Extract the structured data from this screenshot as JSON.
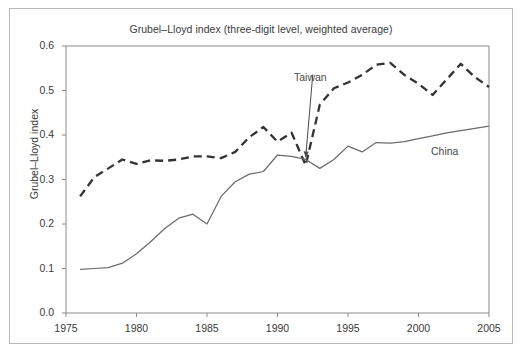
{
  "chart_data": {
    "type": "line",
    "title": "Grubel–Lloyd index (three-digit level, weighted average)",
    "xlabel": "",
    "ylabel": "Grubel–Lloyd index",
    "xlim": [
      1975,
      2005
    ],
    "ylim": [
      0.0,
      0.6
    ],
    "xticks": [
      1975,
      1980,
      1985,
      1990,
      1995,
      2000,
      2005
    ],
    "xtick_labels": [
      "1975",
      "1980",
      "1985",
      "1990",
      "1995",
      "2000",
      "2005"
    ],
    "yticks": [
      0.0,
      0.1,
      0.2,
      0.3,
      0.4,
      0.5,
      0.6
    ],
    "ytick_labels": [
      "0.0",
      "0.1",
      "0.2",
      "0.3",
      "0.4",
      "0.5",
      "0.6"
    ],
    "grid": false,
    "legend_position": "inline-annotation",
    "x": [
      1976,
      1977,
      1978,
      1979,
      1980,
      1981,
      1982,
      1983,
      1984,
      1985,
      1986,
      1987,
      1988,
      1989,
      1990,
      1991,
      1992,
      1993,
      1994,
      1995,
      1996,
      1997,
      1998,
      1999,
      2000,
      2001,
      2002,
      2003,
      2004,
      2005
    ],
    "series": [
      {
        "name": "Taiwan",
        "style": "dashed",
        "color": "#333333",
        "values": [
          0.262,
          0.305,
          0.325,
          0.345,
          0.335,
          0.343,
          0.342,
          0.345,
          0.352,
          0.352,
          0.348,
          0.362,
          0.395,
          0.418,
          0.385,
          0.405,
          0.332,
          0.468,
          0.505,
          0.518,
          0.535,
          0.558,
          0.562,
          0.535,
          0.515,
          0.49,
          0.525,
          0.56,
          0.53,
          0.508
        ]
      },
      {
        "name": "China",
        "style": "solid",
        "color": "#6b6b6b",
        "values": [
          0.098,
          0.1,
          0.102,
          0.112,
          0.133,
          0.16,
          0.19,
          0.213,
          0.222,
          0.2,
          0.262,
          0.295,
          0.312,
          0.318,
          0.355,
          0.352,
          0.345,
          0.325,
          0.345,
          0.375,
          0.362,
          0.383,
          0.382,
          0.385,
          0.392,
          0.398,
          0.405,
          0.41,
          0.415,
          0.42
        ]
      }
    ],
    "annotations": [
      {
        "text": "Taiwan",
        "x": 1992.5,
        "y": 0.545,
        "points_to": {
          "x": 1992.0,
          "y": 0.345
        }
      },
      {
        "text": "China",
        "x": 2001.3,
        "y": 0.375
      }
    ]
  }
}
